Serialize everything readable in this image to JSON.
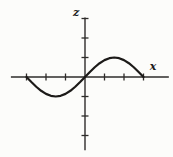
{
  "figure": {
    "background_color": "#fcfcfa",
    "axis_color": "#2e2c2a",
    "curve_color": "#1c1a18"
  },
  "chart_data": {
    "type": "line",
    "title": "",
    "xlabel": "x",
    "ylabel": "z",
    "grid": false,
    "legend": "none",
    "x_axis_range": [
      -3.8,
      4.3
    ],
    "z_axis_range": [
      -3.75,
      3.05
    ],
    "x_ticks": [
      -3,
      -2,
      -1,
      1,
      2,
      3
    ],
    "z_ticks": [
      -3,
      -2,
      -1,
      1,
      2,
      3
    ],
    "series": [
      {
        "name": "z = sin(pi*x/3)",
        "x": [
          -3,
          -2.75,
          -2.5,
          -2.25,
          -2,
          -1.75,
          -1.5,
          -1.25,
          -1,
          -0.75,
          -0.5,
          -0.25,
          0,
          0.25,
          0.5,
          0.75,
          1,
          1.25,
          1.5,
          1.75,
          2,
          2.25,
          2.5,
          2.75,
          3
        ],
        "z": [
          0,
          -0.2588,
          -0.5,
          -0.7071,
          -0.866,
          -0.9659,
          -1,
          -0.9659,
          -0.866,
          -0.7071,
          -0.5,
          -0.2588,
          0,
          0.2588,
          0.5,
          0.7071,
          0.866,
          0.9659,
          1,
          0.9659,
          0.866,
          0.7071,
          0.5,
          0.2588,
          0
        ]
      }
    ]
  }
}
